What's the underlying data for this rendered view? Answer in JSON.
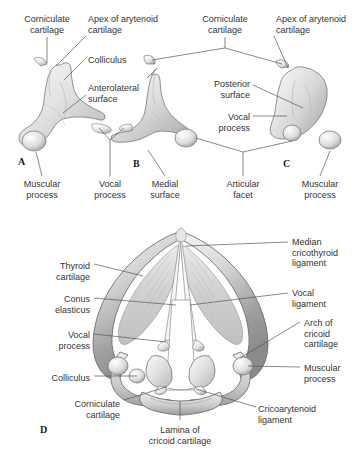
{
  "figure": {
    "background_color": "#ffffff",
    "text_color": "#333333",
    "leader_color": "#555555",
    "cartilage_light": "#efefef",
    "cartilage_mid": "#d2d2d2",
    "cartilage_dark": "#9a9a9a",
    "outline_color": "#6e6e6e"
  },
  "panels": [
    {
      "id": "A",
      "label": "A",
      "x": 18,
      "y": 156
    },
    {
      "id": "B",
      "label": "B",
      "x": 133,
      "y": 158
    },
    {
      "id": "C",
      "label": "C",
      "x": 283,
      "y": 158
    },
    {
      "id": "D",
      "label": "D",
      "x": 40,
      "y": 424
    }
  ],
  "labels": [
    {
      "name": "corniculate-cartilage-a",
      "text": "Corniculate\ncartilage",
      "x": 47,
      "y": 14,
      "align": "center"
    },
    {
      "name": "apex-arytenoid-a",
      "text": "Apex of arytenoid\ncartilage",
      "x": 88,
      "y": 14,
      "align": "left"
    },
    {
      "name": "colliculus-a",
      "text": "Colliculus",
      "x": 88,
      "y": 55,
      "align": "left"
    },
    {
      "name": "anterolateral-surface-a",
      "text": "Anterolateral\nsurface",
      "x": 88,
      "y": 83,
      "align": "left"
    },
    {
      "name": "muscular-process-a",
      "text": "Muscular\nprocess",
      "x": 42,
      "y": 179,
      "align": "center"
    },
    {
      "name": "vocal-process-a",
      "text": "Vocal\nprocess",
      "x": 110,
      "y": 179,
      "align": "center"
    },
    {
      "name": "medial-surface-b",
      "text": "Medial\nsurface",
      "x": 165,
      "y": 179,
      "align": "center"
    },
    {
      "name": "corniculate-cartilage-c",
      "text": "Corniculate\ncartilage",
      "x": 225,
      "y": 14,
      "align": "center"
    },
    {
      "name": "apex-arytenoid-c",
      "text": "Apex of arytenoid\ncartilage",
      "x": 276,
      "y": 14,
      "align": "left"
    },
    {
      "name": "posterior-surface-c",
      "text": "Posterior\nsurface",
      "x": 250,
      "y": 79,
      "align": "right"
    },
    {
      "name": "vocal-process-c",
      "text": "Vocal\nprocess",
      "x": 250,
      "y": 112,
      "align": "right"
    },
    {
      "name": "articular-facet",
      "text": "Articular\nfacet",
      "x": 243,
      "y": 179,
      "align": "center"
    },
    {
      "name": "muscular-process-c",
      "text": "Muscular\nprocess",
      "x": 320,
      "y": 179,
      "align": "center"
    },
    {
      "name": "thyroid-cartilage-d",
      "text": "Thyroid\ncartilage",
      "x": 90,
      "y": 261,
      "align": "right"
    },
    {
      "name": "conus-elasticus-d",
      "text": "Conus\nelasticus",
      "x": 90,
      "y": 294,
      "align": "right"
    },
    {
      "name": "vocal-process-d",
      "text": "Vocal\nprocess",
      "x": 90,
      "y": 330,
      "align": "right"
    },
    {
      "name": "colliculus-d",
      "text": "Colliculus",
      "x": 90,
      "y": 373,
      "align": "right"
    },
    {
      "name": "corniculate-cartilage-d",
      "text": "Corniculate\ncartilage",
      "x": 120,
      "y": 399,
      "align": "right"
    },
    {
      "name": "lamina-cricoid-d",
      "text": "Lamina of\ncricoid cartilage",
      "x": 180,
      "y": 425,
      "align": "center"
    },
    {
      "name": "median-cricothyroid-d",
      "text": "Median\ncricothyroid\nligament",
      "x": 292,
      "y": 237,
      "align": "left"
    },
    {
      "name": "vocal-ligament-d",
      "text": "Vocal\nligament",
      "x": 292,
      "y": 288,
      "align": "left"
    },
    {
      "name": "arch-cricoid-d",
      "text": "Arch of\ncricoid\ncartilage",
      "x": 304,
      "y": 318,
      "align": "left"
    },
    {
      "name": "muscular-process-d",
      "text": "Muscular\nprocess",
      "x": 304,
      "y": 363,
      "align": "left"
    },
    {
      "name": "cricoarytenoid-ligament-d",
      "text": "Cricoarytenoid\nligament",
      "x": 258,
      "y": 404,
      "align": "left"
    }
  ]
}
